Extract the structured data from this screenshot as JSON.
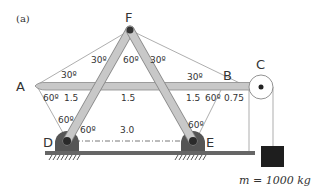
{
  "figure": {
    "panel_label": "(a)",
    "points": {
      "A": "A",
      "B": "B",
      "C": "C",
      "D": "D",
      "E": "E",
      "F": "F"
    },
    "angles": {
      "F_left": "30º",
      "F_mid": "60º",
      "F_right": "30º",
      "A_top": "30º",
      "A_bottom": "60º",
      "B_top": "30º",
      "B_bottom": "60º",
      "D_top": "60º",
      "D_right": "60º",
      "E_top": "60º"
    },
    "lengths": {
      "A_seg": "1.5",
      "mid_seg": "1.5",
      "B_seg": "1.5",
      "B_ext": "0.75",
      "DE": "3.0"
    },
    "mass_label": "m = 1000 kg",
    "colors": {
      "member_fill": "#c8c8c8",
      "member_stroke": "#8a8a8a",
      "support_fill": "#555555",
      "mass_fill": "#1e1e1e",
      "line": "#555555"
    }
  }
}
